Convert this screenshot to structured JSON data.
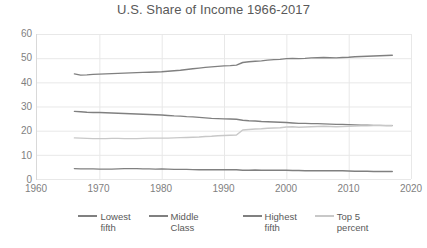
{
  "chart_data": {
    "type": "line",
    "title": "U.S. Share of Income 1966-2017",
    "xlabel": "",
    "ylabel": "",
    "xlim": [
      1960,
      2020
    ],
    "ylim": [
      0,
      60
    ],
    "xticks": [
      1960,
      1970,
      1980,
      1990,
      2000,
      2010,
      2020
    ],
    "yticks": [
      0,
      10,
      20,
      30,
      40,
      50,
      60
    ],
    "grid": true,
    "legend_position": "bottom",
    "x": [
      1966,
      1967,
      1968,
      1969,
      1970,
      1971,
      1972,
      1973,
      1974,
      1975,
      1976,
      1977,
      1978,
      1979,
      1980,
      1981,
      1982,
      1983,
      1984,
      1985,
      1986,
      1987,
      1988,
      1989,
      1990,
      1991,
      1992,
      1993,
      1994,
      1995,
      1996,
      1997,
      1998,
      1999,
      2000,
      2001,
      2002,
      2003,
      2004,
      2005,
      2006,
      2007,
      2008,
      2009,
      2010,
      2011,
      2012,
      2013,
      2014,
      2015,
      2016,
      2017
    ],
    "series": [
      {
        "name": "Lowest fifth",
        "color": "#808080",
        "values": [
          4.3,
          4.2,
          4.2,
          4.2,
          4.1,
          4.1,
          4.1,
          4.2,
          4.3,
          4.3,
          4.3,
          4.2,
          4.2,
          4.1,
          4.2,
          4.1,
          4.0,
          4.0,
          4.0,
          3.9,
          3.8,
          3.8,
          3.8,
          3.8,
          3.8,
          3.8,
          3.8,
          3.6,
          3.6,
          3.7,
          3.6,
          3.6,
          3.6,
          3.6,
          3.6,
          3.5,
          3.5,
          3.4,
          3.4,
          3.4,
          3.4,
          3.4,
          3.4,
          3.4,
          3.3,
          3.2,
          3.2,
          3.2,
          3.1,
          3.1,
          3.1,
          3.1
        ]
      },
      {
        "name": "Middle Class",
        "color": "#808080",
        "values": [
          28.0,
          27.8,
          27.6,
          27.5,
          27.5,
          27.4,
          27.3,
          27.2,
          27.1,
          27.0,
          26.9,
          26.8,
          26.7,
          26.6,
          26.5,
          26.3,
          26.1,
          26.0,
          25.8,
          25.7,
          25.5,
          25.3,
          25.1,
          25.0,
          24.9,
          24.8,
          24.7,
          24.3,
          24.1,
          24.0,
          23.8,
          23.7,
          23.6,
          23.5,
          23.4,
          23.2,
          23.0,
          23.0,
          22.9,
          22.9,
          22.8,
          22.7,
          22.6,
          22.6,
          22.5,
          22.4,
          22.3,
          22.3,
          22.2,
          22.2,
          22.1,
          22.1
        ]
      },
      {
        "name": "Highest fifth",
        "color": "#808080",
        "values": [
          43.5,
          43.0,
          43.1,
          43.3,
          43.4,
          43.5,
          43.6,
          43.7,
          43.8,
          43.9,
          44.0,
          44.1,
          44.2,
          44.3,
          44.4,
          44.6,
          44.8,
          45.0,
          45.3,
          45.6,
          45.9,
          46.2,
          46.4,
          46.6,
          46.8,
          46.9,
          47.1,
          48.2,
          48.5,
          48.7,
          48.9,
          49.2,
          49.4,
          49.5,
          49.8,
          49.9,
          49.8,
          49.9,
          50.1,
          50.2,
          50.3,
          50.2,
          50.1,
          50.3,
          50.4,
          50.6,
          50.7,
          50.8,
          50.9,
          51.0,
          51.1,
          51.2
        ]
      },
      {
        "name": "Top 5 percent",
        "color": "#c8c8c8",
        "values": [
          17.0,
          16.9,
          16.8,
          16.7,
          16.7,
          16.7,
          16.8,
          16.8,
          16.7,
          16.7,
          16.7,
          16.8,
          16.9,
          16.9,
          16.9,
          16.9,
          17.0,
          17.1,
          17.2,
          17.3,
          17.4,
          17.6,
          17.7,
          17.9,
          18.0,
          18.1,
          18.2,
          20.3,
          20.5,
          20.7,
          20.8,
          21.0,
          21.1,
          21.2,
          21.5,
          21.6,
          21.4,
          21.5,
          21.6,
          21.7,
          21.8,
          21.7,
          21.6,
          21.7,
          21.8,
          21.9,
          22.0,
          22.0,
          22.1,
          22.1,
          22.2,
          22.2
        ]
      }
    ]
  },
  "legend": {
    "items": [
      {
        "label_line1": "Lowest",
        "label_line2": "fifth",
        "color": "#808080"
      },
      {
        "label_line1": "Middle  Class",
        "label_line2": "",
        "color": "#808080"
      },
      {
        "label_line1": "Highest",
        "label_line2": "fifth",
        "color": "#808080"
      },
      {
        "label_line1": "Top 5",
        "label_line2": "percent",
        "color": "#c8c8c8"
      }
    ]
  },
  "style": {
    "grid_color": "#e8e8e8",
    "axis_color": "#d9d9d9",
    "text_color": "#595959",
    "tick_color": "#7f7f7f",
    "background": "#ffffff"
  }
}
